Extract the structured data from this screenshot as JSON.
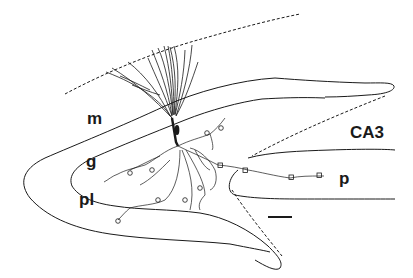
{
  "figure": {
    "type": "neuron camera-lucida drawing in hippocampal dentate gyrus",
    "colors": {
      "ink": "#1a1a1a",
      "background": "#ffffff"
    },
    "labels": {
      "molecular_layer": "m",
      "granule_layer": "g",
      "polymorphic_layer": "pl",
      "ca3_region": "CA3",
      "projection": "p"
    },
    "scale_bar": {
      "visible": true,
      "text": ""
    }
  }
}
